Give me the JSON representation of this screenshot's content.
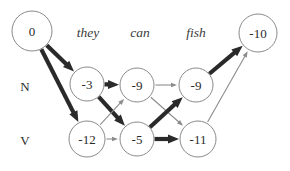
{
  "figure": {
    "name": "viterbi-lattice",
    "background": "#ffffff",
    "colors": {
      "node_stroke": "#8a8a8a",
      "node_fill": "#ffffff",
      "text": "#2b2b2b",
      "edge_thin": "#8c8c8c",
      "edge_bold": "#2a2a2a"
    }
  },
  "words": [
    {
      "id": "word-they",
      "label": "they",
      "x": 88,
      "y": 32
    },
    {
      "id": "word-can",
      "label": "can",
      "x": 140,
      "y": 32
    },
    {
      "id": "word-fish",
      "label": "fish",
      "x": 196,
      "y": 32
    }
  ],
  "row_labels": [
    {
      "id": "row-N",
      "label": "N",
      "x": 25,
      "y": 86
    },
    {
      "id": "row-V",
      "label": "V",
      "x": 25,
      "y": 140
    }
  ],
  "nodes": [
    {
      "id": "start",
      "label": "0",
      "x": 32,
      "y": 31,
      "r": 20
    },
    {
      "id": "n-they",
      "label": "-3",
      "x": 87,
      "y": 84,
      "r": 17
    },
    {
      "id": "v-they",
      "label": "-12",
      "x": 87,
      "y": 139,
      "r": 18
    },
    {
      "id": "n-can",
      "label": "-9",
      "x": 137,
      "y": 85,
      "r": 17
    },
    {
      "id": "v-can",
      "label": "-5",
      "x": 137,
      "y": 139,
      "r": 17
    },
    {
      "id": "n-fish",
      "label": "-9",
      "x": 196,
      "y": 85,
      "r": 17
    },
    {
      "id": "v-fish",
      "label": "-11",
      "x": 198,
      "y": 139,
      "r": 18
    },
    {
      "id": "end",
      "label": "-10",
      "x": 258,
      "y": 33,
      "r": 19
    }
  ],
  "edges": [
    {
      "id": "e-start-n-they",
      "from": "start",
      "to": "n-they",
      "weight": "bold"
    },
    {
      "id": "e-start-v-they",
      "from": "start",
      "to": "v-they",
      "weight": "bold"
    },
    {
      "id": "e-nthey-ncan",
      "from": "n-they",
      "to": "n-can",
      "weight": "bold"
    },
    {
      "id": "e-nthey-vcan",
      "from": "n-they",
      "to": "v-can",
      "weight": "bold"
    },
    {
      "id": "e-vthey-ncan",
      "from": "v-they",
      "to": "n-can",
      "weight": "thin"
    },
    {
      "id": "e-vthey-vcan",
      "from": "v-they",
      "to": "v-can",
      "weight": "thin"
    },
    {
      "id": "e-ncan-nfish",
      "from": "n-can",
      "to": "n-fish",
      "weight": "thin"
    },
    {
      "id": "e-ncan-vfish",
      "from": "n-can",
      "to": "v-fish",
      "weight": "thin"
    },
    {
      "id": "e-vcan-nfish",
      "from": "v-can",
      "to": "n-fish",
      "weight": "bold"
    },
    {
      "id": "e-vcan-vfish",
      "from": "v-can",
      "to": "v-fish",
      "weight": "bold"
    },
    {
      "id": "e-nfish-end",
      "from": "n-fish",
      "to": "end",
      "weight": "bold"
    },
    {
      "id": "e-vfish-end",
      "from": "v-fish",
      "to": "end",
      "weight": "thin"
    }
  ],
  "chart_data": {
    "type": "diagram",
    "title": "",
    "sequence": [
      "they",
      "can",
      "fish"
    ],
    "tags": [
      "N",
      "V"
    ],
    "scores": {
      "start": 0,
      "they": {
        "N": -3,
        "V": -12
      },
      "can": {
        "N": -9,
        "V": -5
      },
      "fish": {
        "N": -9,
        "V": -11
      },
      "end": -10
    },
    "highlighted_paths": [
      [
        "start",
        "n-they"
      ],
      [
        "start",
        "v-they"
      ],
      [
        "n-they",
        "n-can"
      ],
      [
        "n-they",
        "v-can"
      ],
      [
        "v-can",
        "n-fish"
      ],
      [
        "v-can",
        "v-fish"
      ],
      [
        "n-fish",
        "end"
      ]
    ]
  }
}
